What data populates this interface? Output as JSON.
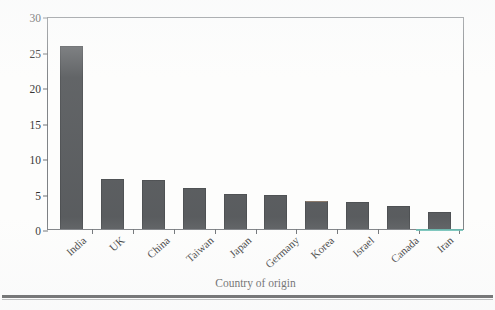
{
  "chart_data": {
    "type": "bar",
    "title": "",
    "xlabel": "Country of origin",
    "ylabel": "Percentage of founders",
    "categories": [
      "India",
      "UK",
      "China",
      "Taiwan",
      "Japan",
      "Germany",
      "Korea",
      "Israel",
      "Canada",
      "Iran"
    ],
    "values": [
      25.8,
      7.1,
      6.9,
      5.8,
      5.0,
      4.85,
      4.0,
      3.8,
      3.2,
      2.4
    ],
    "ylim": [
      0,
      30
    ],
    "yticks": [
      0,
      5,
      10,
      15,
      20,
      25,
      30
    ],
    "ytick_labels": [
      "0",
      "5",
      "10",
      "15",
      "20",
      "25",
      "30"
    ],
    "grid": false,
    "legend": null,
    "bar_color": "#474a4d",
    "axis_color": "#6e7276",
    "background_color": "#fdfdfc",
    "artifact_color": "#4fb3a6"
  }
}
